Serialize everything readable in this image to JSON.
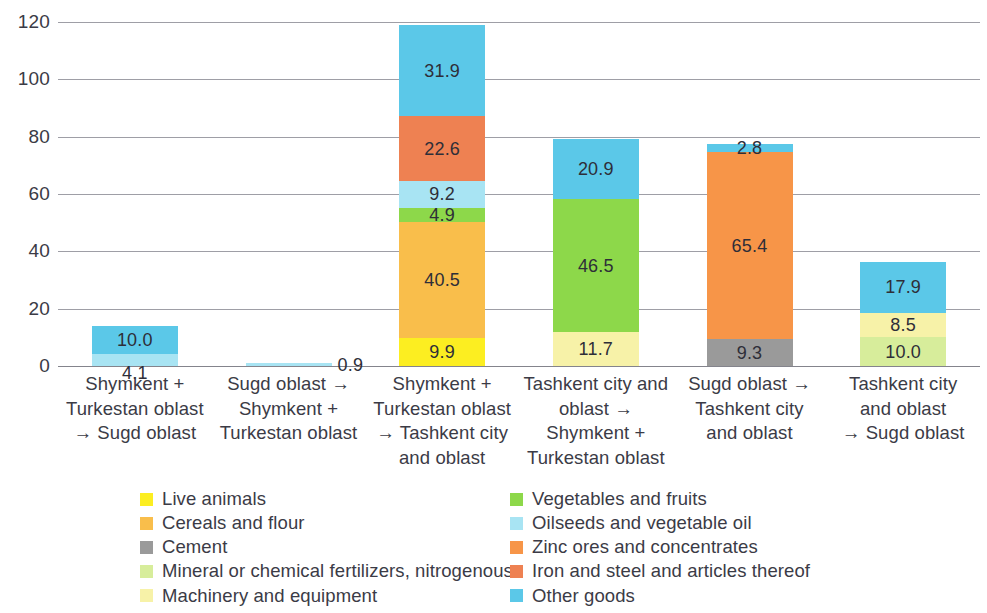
{
  "chart_data": {
    "type": "bar",
    "subtype": "stacked-column",
    "title": "",
    "xlabel": "",
    "ylabel": "",
    "ylim": [
      0,
      120
    ],
    "y_ticks": [
      "0",
      "20",
      "40",
      "60",
      "80",
      "100",
      "120"
    ],
    "grid": true,
    "legend_position": "bottom",
    "categories": [
      "Shymkent + Turkestan oblast → Sugd oblast",
      "Sugd oblast → Shymkent + Turkestan oblast",
      "Shymkent + Turkestan oblast → Tashkent city and oblast",
      "Tashkent city and oblast → Shymkent + Turkestan oblast",
      "Sugd oblast → Tashkent city and oblast",
      "Tashkent city and oblast → Sugd oblast"
    ],
    "series": [
      {
        "name": "Live animals",
        "color": "#FCEE21",
        "values": [
          0,
          0,
          9.9,
          0,
          0,
          0
        ]
      },
      {
        "name": "Cereals and flour",
        "color": "#F9BE4B",
        "values": [
          0,
          0,
          40.5,
          0,
          0,
          0
        ]
      },
      {
        "name": "Cement",
        "color": "#9A9A9A",
        "values": [
          0,
          0,
          0,
          0,
          9.3,
          0
        ]
      },
      {
        "name": "Mineral or chemical fertilizers, nitrogenous",
        "color": "#D7ED9B",
        "values": [
          0,
          0,
          0,
          0,
          0,
          10.0
        ]
      },
      {
        "name": "Machinery and equipment",
        "color": "#F7F2A8",
        "values": [
          0,
          0,
          0,
          11.7,
          0,
          8.5
        ]
      },
      {
        "name": "Vegetables and fruits",
        "color": "#8DD84A",
        "values": [
          0,
          0,
          4.9,
          46.5,
          0,
          0
        ]
      },
      {
        "name": "Oilseeds and vegetable oil",
        "color": "#A8E4F3",
        "values": [
          4.1,
          0.9,
          9.2,
          0,
          0,
          0
        ]
      },
      {
        "name": "Zinc ores and concentrates",
        "color": "#F79548",
        "values": [
          0,
          0,
          0,
          0,
          65.4,
          0
        ]
      },
      {
        "name": "Iron and steel and articles thereof",
        "color": "#EE8152",
        "values": [
          0,
          0,
          22.6,
          0,
          0,
          0
        ]
      },
      {
        "name": "Other goods",
        "color": "#5BC8E8",
        "values": [
          10.0,
          0,
          31.9,
          20.9,
          2.8,
          17.9
        ]
      }
    ],
    "bar_totals": [
      14.1,
      0.9,
      119.0,
      79.1,
      77.5,
      36.4
    ],
    "data_labels": [
      {
        "bar": 0,
        "series": "Oilseeds and vegetable oil",
        "text": "4.1",
        "placement": "below-bar"
      },
      {
        "bar": 0,
        "series": "Other goods",
        "text": "10.0",
        "placement": "inside"
      },
      {
        "bar": 1,
        "series": "Oilseeds and vegetable oil",
        "text": "0.9",
        "placement": "right"
      },
      {
        "bar": 2,
        "series": "Live animals",
        "text": "9.9",
        "placement": "inside"
      },
      {
        "bar": 2,
        "series": "Cereals and flour",
        "text": "40.5",
        "placement": "inside"
      },
      {
        "bar": 2,
        "series": "Vegetables and fruits",
        "text": "4.9",
        "placement": "inside"
      },
      {
        "bar": 2,
        "series": "Oilseeds and vegetable oil",
        "text": "9.2",
        "placement": "inside"
      },
      {
        "bar": 2,
        "series": "Iron and steel and articles thereof",
        "text": "22.6",
        "placement": "inside"
      },
      {
        "bar": 2,
        "series": "Other goods",
        "text": "31.9",
        "placement": "inside"
      },
      {
        "bar": 3,
        "series": "Machinery and equipment",
        "text": "11.7",
        "placement": "inside"
      },
      {
        "bar": 3,
        "series": "Vegetables and fruits",
        "text": "46.5",
        "placement": "inside"
      },
      {
        "bar": 3,
        "series": "Other goods",
        "text": "20.9",
        "placement": "inside"
      },
      {
        "bar": 4,
        "series": "Cement",
        "text": "9.3",
        "placement": "inside"
      },
      {
        "bar": 4,
        "series": "Zinc ores and concentrates",
        "text": "65.4",
        "placement": "inside"
      },
      {
        "bar": 4,
        "series": "Other goods",
        "text": "2.8",
        "placement": "inside"
      },
      {
        "bar": 5,
        "series": "Mineral or chemical fertilizers, nitrogenous",
        "text": "10.0",
        "placement": "inside"
      },
      {
        "bar": 5,
        "series": "Machinery and equipment",
        "text": "8.5",
        "placement": "inside"
      },
      {
        "bar": 5,
        "series": "Other goods",
        "text": "17.9",
        "placement": "inside"
      }
    ]
  },
  "axis": {
    "y_ticks": [
      "120",
      "100",
      "80",
      "60",
      "40",
      "20",
      "0"
    ]
  },
  "x_axis": {
    "labels": [
      {
        "lines": [
          "Shymkent +",
          "Turkestan oblast",
          "→ Sugd oblast"
        ]
      },
      {
        "lines": [
          "Sugd oblast →",
          "Shymkent +",
          "Turkestan oblast"
        ]
      },
      {
        "lines": [
          "Shymkent +",
          "Turkestan oblast",
          "→ Tashkent city",
          "and oblast"
        ]
      },
      {
        "lines": [
          "Tashkent city and",
          "oblast →",
          "Shymkent +",
          "Turkestan oblast"
        ]
      },
      {
        "lines": [
          "Sugd oblast →",
          "Tashkent city",
          "and oblast"
        ]
      },
      {
        "lines": [
          "Tashkent city",
          "and oblast",
          "→ Sugd oblast"
        ]
      }
    ]
  },
  "legend": {
    "left_column": [
      {
        "label": "Live animals",
        "color": "#FCEE21"
      },
      {
        "label": "Cereals and flour",
        "color": "#F9BE4B"
      },
      {
        "label": "Cement",
        "color": "#9A9A9A"
      },
      {
        "label": "Mineral or chemical fertilizers, nitrogenous",
        "color": "#D7ED9B"
      },
      {
        "label": "Machinery and equipment",
        "color": "#F7F2A8"
      }
    ],
    "right_column": [
      {
        "label": "Vegetables and fruits",
        "color": "#8DD84A"
      },
      {
        "label": "Oilseeds and vegetable oil",
        "color": "#A8E4F3"
      },
      {
        "label": "Zinc ores and concentrates",
        "color": "#F79548"
      },
      {
        "label": "Iron and steel and articles thereof",
        "color": "#EE8152"
      },
      {
        "label": "Other goods",
        "color": "#5BC8E8"
      }
    ]
  }
}
